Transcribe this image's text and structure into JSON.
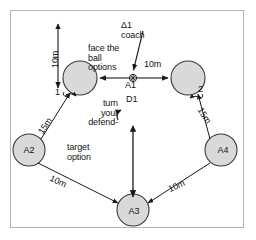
{
  "diagram": {
    "title_note": "soccer-drill-diagram",
    "frame_color": "#b4b4b4",
    "circle_fill": "#d9d9d9",
    "circle_stroke": "#3a3a3a",
    "line_color": "#1a1a1a",
    "text_color": "#141414",
    "players": [
      {
        "id": "p-top-left",
        "label": "",
        "cx": 80,
        "cy": 78,
        "r": 17
      },
      {
        "id": "p-top-right",
        "label": "",
        "cx": 188,
        "cy": 78,
        "r": 17
      },
      {
        "id": "p-a2",
        "label": "A2",
        "cx": 29,
        "cy": 150,
        "r": 16
      },
      {
        "id": "p-a4",
        "label": "A4",
        "cx": 221,
        "cy": 150,
        "r": 16
      },
      {
        "id": "p-a3",
        "label": "A3",
        "cx": 133,
        "cy": 210,
        "r": 16
      }
    ],
    "ball": {
      "cx": 133,
      "cy": 78,
      "r": 3.5
    },
    "labels": {
      "coach": "Δ1\ncoach",
      "face_the_ball_options": "face the\nball\noptions",
      "distance_top_vertical": "10m",
      "distance_center_right": "10m",
      "ball_carrier": "A1",
      "defender": "D1",
      "turn_your_defend": "turn\nyour\ndefend-",
      "target_option": "target\noption",
      "run_one": "1",
      "run_two": "2",
      "distance_left_diagonal": "15m",
      "distance_right_diagonal": "15m",
      "distance_bottom_left": "10m",
      "distance_bottom_right": "10m"
    }
  }
}
